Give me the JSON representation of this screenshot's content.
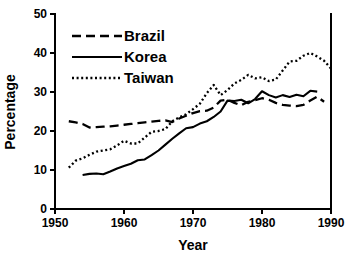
{
  "chart_data": {
    "type": "line",
    "title": "",
    "xlabel": "Year",
    "ylabel": "Percentage",
    "xlim": [
      1950,
      1990
    ],
    "ylim": [
      0,
      50
    ],
    "xticks": [
      1950,
      1960,
      1970,
      1980,
      1990
    ],
    "yticks": [
      0,
      10,
      20,
      30,
      40,
      50
    ],
    "grid": false,
    "legend_position": "upper-left",
    "series": [
      {
        "name": "Brazil",
        "style": "dashed",
        "color": "#000000",
        "x": [
          1952,
          1953,
          1954,
          1955,
          1956,
          1957,
          1958,
          1959,
          1960,
          1961,
          1962,
          1963,
          1964,
          1965,
          1966,
          1967,
          1968,
          1969,
          1970,
          1971,
          1972,
          1973,
          1974,
          1975,
          1976,
          1977,
          1978,
          1979,
          1980,
          1981,
          1982,
          1983,
          1984,
          1985,
          1986,
          1987,
          1988,
          1989
        ],
        "y": [
          22.5,
          22.2,
          21.8,
          20.9,
          21.0,
          21.1,
          21.2,
          21.4,
          21.6,
          21.8,
          22.0,
          22.2,
          22.4,
          22.6,
          22.7,
          22.3,
          23.2,
          23.9,
          24.6,
          25.1,
          25.2,
          26.0,
          27.8,
          28.0,
          27.2,
          26.6,
          27.5,
          27.9,
          28.4,
          28.0,
          27.2,
          26.7,
          26.5,
          26.4,
          26.7,
          27.8,
          28.8,
          27.5
        ]
      },
      {
        "name": "Korea",
        "style": "solid",
        "color": "#000000",
        "x": [
          1954,
          1955,
          1956,
          1957,
          1958,
          1959,
          1960,
          1961,
          1962,
          1963,
          1964,
          1965,
          1966,
          1967,
          1968,
          1969,
          1970,
          1971,
          1972,
          1973,
          1974,
          1975,
          1976,
          1977,
          1978,
          1979,
          1980,
          1981,
          1982,
          1983,
          1984,
          1985,
          1986,
          1987,
          1988
        ],
        "y": [
          8.7,
          9.0,
          9.1,
          8.9,
          9.6,
          10.4,
          11.0,
          11.6,
          12.5,
          12.7,
          13.8,
          15.0,
          16.5,
          18.0,
          19.4,
          20.7,
          21.0,
          21.9,
          22.5,
          23.6,
          25.0,
          27.8,
          27.7,
          28.0,
          27.1,
          28.2,
          30.2,
          29.2,
          28.6,
          29.2,
          28.7,
          29.3,
          28.9,
          30.3,
          30.1
        ]
      },
      {
        "name": "Taiwan",
        "style": "dotted",
        "color": "#000000",
        "x": [
          1952,
          1953,
          1954,
          1955,
          1956,
          1957,
          1958,
          1959,
          1960,
          1961,
          1962,
          1963,
          1964,
          1965,
          1966,
          1967,
          1968,
          1969,
          1970,
          1971,
          1972,
          1973,
          1974,
          1975,
          1976,
          1977,
          1978,
          1979,
          1980,
          1981,
          1982,
          1983,
          1984,
          1985,
          1986,
          1987,
          1988,
          1989,
          1990
        ],
        "y": [
          10.6,
          12.4,
          13.0,
          13.9,
          14.7,
          15.0,
          15.3,
          16.3,
          17.5,
          16.8,
          16.8,
          18.3,
          19.8,
          20.0,
          20.5,
          22.5,
          23.5,
          24.3,
          25.6,
          27.0,
          29.7,
          31.8,
          29.2,
          30.5,
          32.2,
          33.1,
          34.4,
          33.5,
          33.8,
          32.8,
          33.2,
          35.5,
          37.8,
          38.0,
          39.3,
          40.0,
          39.1,
          38.0,
          36.0
        ]
      }
    ]
  }
}
